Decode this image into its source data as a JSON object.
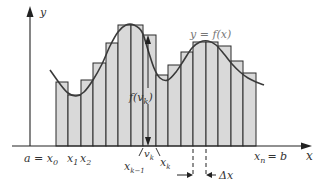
{
  "figure": {
    "type": "riemann-sum-diagram",
    "colors": {
      "bar_fill": "#d9d9d9",
      "bar_stroke": "#2a2a2a",
      "curve": "#3a3a3a",
      "axis": "#222222",
      "label": "#333333",
      "curve_label": "#777777"
    },
    "axes": {
      "x_label": "x",
      "y_label": "y",
      "origin": {
        "x": 30,
        "y": 146
      },
      "x_end": 312,
      "y_top": 6
    },
    "curve_label": "y = f(x)",
    "height_label": "f(v",
    "height_label_sub": "k",
    "height_label_close": ")",
    "labels": {
      "a_eq_x0": "a = x",
      "x0_sub": "0",
      "x1": "x",
      "x1_sub": "1",
      "x2": "x",
      "x2_sub": "2",
      "vk": "v",
      "vk_sub": "k",
      "xk_1": "x",
      "xk_1_sub": "k−1",
      "xk": "x",
      "xk_sub": "k",
      "xn": "x",
      "xn_sub": "n",
      "eq_b": "= b",
      "delta_x": "Δx"
    },
    "bars": [
      {
        "x0": 56,
        "x1": 68,
        "top": 82
      },
      {
        "x0": 68,
        "x1": 81,
        "top": 95
      },
      {
        "x0": 81,
        "x1": 93,
        "top": 80
      },
      {
        "x0": 93,
        "x1": 106,
        "top": 63
      },
      {
        "x0": 106,
        "x1": 118,
        "top": 43
      },
      {
        "x0": 118,
        "x1": 131,
        "top": 25
      },
      {
        "x0": 131,
        "x1": 143,
        "top": 25
      },
      {
        "x0": 143,
        "x1": 156,
        "top": 35
      },
      {
        "x0": 156,
        "x1": 168,
        "top": 75
      },
      {
        "x0": 168,
        "x1": 181,
        "top": 65
      },
      {
        "x0": 181,
        "x1": 193,
        "top": 52
      },
      {
        "x0": 193,
        "x1": 206,
        "top": 42
      },
      {
        "x0": 206,
        "x1": 218,
        "top": 42
      },
      {
        "x0": 218,
        "x1": 231,
        "top": 46
      },
      {
        "x0": 231,
        "x1": 243,
        "top": 61
      },
      {
        "x0": 243,
        "x1": 256,
        "top": 73
      }
    ],
    "curve_points": [
      [
        50,
        70
      ],
      [
        60,
        84
      ],
      [
        68,
        93
      ],
      [
        76,
        96
      ],
      [
        84,
        92
      ],
      [
        93,
        80
      ],
      [
        102,
        64
      ],
      [
        110,
        46
      ],
      [
        118,
        32
      ],
      [
        126,
        25
      ],
      [
        134,
        25
      ],
      [
        142,
        32
      ],
      [
        148,
        50
      ],
      [
        154,
        68
      ],
      [
        160,
        78
      ],
      [
        168,
        80
      ],
      [
        176,
        72
      ],
      [
        184,
        60
      ],
      [
        192,
        48
      ],
      [
        200,
        42
      ],
      [
        208,
        41
      ],
      [
        216,
        45
      ],
      [
        224,
        54
      ],
      [
        232,
        64
      ],
      [
        240,
        72
      ],
      [
        248,
        78
      ],
      [
        256,
        82
      ],
      [
        264,
        85
      ]
    ],
    "marker": {
      "x": 148,
      "top": 35,
      "bottom": 146
    }
  }
}
